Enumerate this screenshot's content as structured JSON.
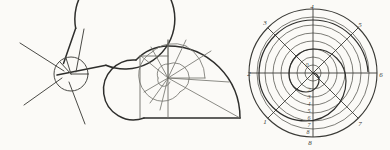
{
  "page": {
    "background_color": "#fbfaf7",
    "ink_color": "#2e2e2c",
    "light_ink_color": "#6e6e68",
    "width": 390,
    "height": 150
  },
  "figures": [
    {
      "name": "sectored-circle-spiral",
      "description": "Large circle with a sector notch cut at the upper right, an inner small circle, and radial chords forming a pinwheel spiral",
      "center": {
        "x": 57,
        "y": 75
      },
      "outer_radius": 50,
      "inner_radius": 17,
      "sector_gap_start_deg": -68,
      "sector_gap_end_deg": -12,
      "radials_deg": [
        -68,
        -12,
        55,
        130,
        200
      ]
    },
    {
      "name": "arc-segment-spiral",
      "description": "Spiral built from successive quarter-circle arc segments of growing radius about a common pole, with chord lines to the pole",
      "pole": {
        "x": 168,
        "y": 78
      },
      "segments": 12,
      "max_radius": 72,
      "growth_ratio": 1.18
    },
    {
      "name": "polar-archimedean-spiral",
      "description": "Polar grid of concentric circles with eight numbered radial rays and an Archimedean spiral; vertical radius carries a numbered scale",
      "center": {
        "x": 313,
        "y": 73
      },
      "outer_radius": 64,
      "circle_count": 8,
      "spiral_turns": 2,
      "ray_labels": [
        {
          "text": "4",
          "angle_deg": -90,
          "x": 312,
          "y": 9
        },
        {
          "text": "5",
          "angle_deg": -45,
          "x": 360,
          "y": 27
        },
        {
          "text": "6",
          "angle_deg": 0,
          "x": 381,
          "y": 77
        },
        {
          "text": "7",
          "angle_deg": 45,
          "x": 360,
          "y": 126
        },
        {
          "text": "8",
          "angle_deg": 90,
          "x": 310,
          "y": 142
        },
        {
          "text": "1",
          "angle_deg": 135,
          "x": 265,
          "y": 124
        },
        {
          "text": "2",
          "angle_deg": 180,
          "x": 249,
          "y": 76
        },
        {
          "text": "3",
          "angle_deg": -135,
          "x": 265,
          "y": 25
        }
      ],
      "center_labels": [
        {
          "text": "0",
          "x": 307,
          "y": 67
        },
        {
          "text": "1",
          "x": 318,
          "y": 79
        }
      ],
      "scale_labels": [
        {
          "text": "2",
          "x": 309,
          "y": 92
        },
        {
          "text": "3",
          "x": 309,
          "y": 99
        },
        {
          "text": "4",
          "x": 309,
          "y": 106
        },
        {
          "text": "5",
          "x": 309,
          "y": 113
        },
        {
          "text": "6",
          "x": 309,
          "y": 120
        },
        {
          "text": "7",
          "x": 309,
          "y": 127
        },
        {
          "text": "8",
          "x": 308,
          "y": 134
        }
      ]
    }
  ]
}
